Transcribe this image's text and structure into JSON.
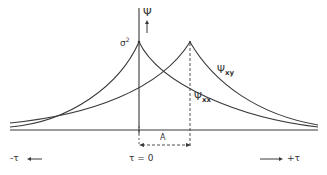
{
  "diagram": {
    "type": "correlation-functions",
    "colors": {
      "line": "#3a3a3a",
      "background": "#ffffff"
    },
    "axis": {
      "vertical_label": "Ψ",
      "vertical_arrow": "↑",
      "origin_label": "τ = 0",
      "left_label": "-τ ←",
      "right_label": "→ +τ"
    },
    "peak_label": "σ",
    "peak_label_sup": "2",
    "curves": [
      {
        "name": "Ψ",
        "subscript": "xx",
        "peak_position": "τ = 0"
      },
      {
        "name": "Ψ",
        "subscript": "xy",
        "peak_position": "τ = A"
      }
    ],
    "shift_label": "A"
  }
}
